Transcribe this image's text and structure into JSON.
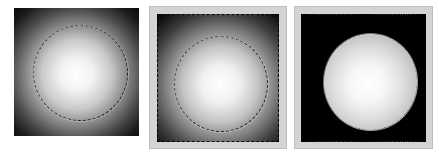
{
  "figure": {
    "panels": [
      {
        "id": "panel-1",
        "label": "Radial gradient with circular selection",
        "background_gradient": {
          "center": "#ffffff",
          "mid": "#9a9a9a",
          "edge": "#0d0d0d"
        },
        "selection": "circle",
        "framed": false
      },
      {
        "id": "panel-2",
        "label": "Radial gradient in canvas with rectangle and circle selections",
        "background_gradient": {
          "center": "#ffffff",
          "mid": "#9a9a9a",
          "edge": "#0d0d0d"
        },
        "selection": "rectangle+circle",
        "framed": true,
        "frame_color": "#d4d4d4"
      },
      {
        "id": "panel-3",
        "label": "Isolated sphere on black background",
        "background_color": "#000000",
        "sphere_gradient": {
          "center": "#ffffff",
          "edge": "#9c9c9c"
        },
        "selection": "rectangle+circle",
        "framed": true,
        "frame_color": "#d4d4d4"
      }
    ]
  }
}
